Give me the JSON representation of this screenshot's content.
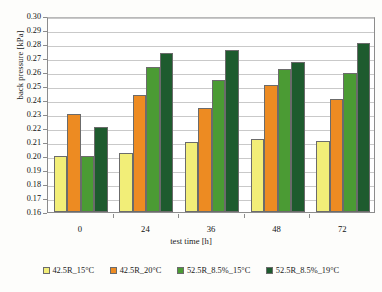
{
  "chart_data": {
    "type": "bar",
    "title": "",
    "xlabel": "test time [h]",
    "ylabel": "back pressure [kPa]",
    "categories": [
      "0",
      "24",
      "36",
      "48",
      "72"
    ],
    "ylim": [
      0.16,
      0.3
    ],
    "ytick_step": 0.01,
    "ytick_labels": [
      "0.30",
      "0.29",
      "0.28",
      "0.27",
      "0.26",
      "0.25",
      "0.24",
      "0.23",
      "0.22",
      "0.21",
      "0.20",
      "0.19",
      "0.18",
      "0.17",
      "0.16"
    ],
    "grid": true,
    "legend_position": "bottom",
    "series": [
      {
        "name": "42.5R_15°C",
        "color": "#F2EE78",
        "values": [
          0.2,
          0.202,
          0.21,
          0.212,
          0.211
        ]
      },
      {
        "name": "42.5R_20°C",
        "color": "#ED8B22",
        "values": [
          0.23,
          0.2435,
          0.2345,
          0.2505,
          0.2405
        ]
      },
      {
        "name": "52.5R_8.5%_15°C",
        "color": "#4B9B34",
        "values": [
          0.2,
          0.2635,
          0.2545,
          0.2625,
          0.2595
        ]
      },
      {
        "name": "52.5R_8.5%_19°C",
        "color": "#1E5B2E",
        "values": [
          0.2205,
          0.2735,
          0.2755,
          0.2675,
          0.2805
        ]
      }
    ]
  }
}
